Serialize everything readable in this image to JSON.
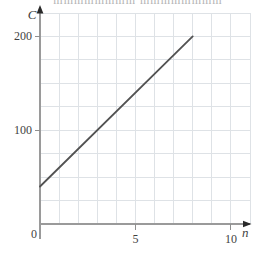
{
  "page": {
    "background": "#ffffff",
    "top_cropped_text": "mmmmmmmm mmmmmmmm"
  },
  "chart_data": {
    "type": "line",
    "title": "",
    "xlabel": "n",
    "ylabel": "C",
    "xlim": [
      0,
      11
    ],
    "ylim": [
      0,
      225
    ],
    "x_grid_step": 1,
    "y_grid_step": 25,
    "grid": true,
    "legend": "none",
    "x_ticks": [
      {
        "value": 5,
        "label": "5"
      },
      {
        "value": 10,
        "label": "10"
      }
    ],
    "y_ticks": [
      {
        "value": 100,
        "label": "100"
      },
      {
        "value": 200,
        "label": "200"
      }
    ],
    "origin_label": "0",
    "series": [
      {
        "name": "cost-line",
        "points": [
          [
            0,
            40
          ],
          [
            8,
            200
          ]
        ]
      }
    ],
    "equation_hint": "C = 20n + 40",
    "colors": {
      "grid": "#dee2e6",
      "axis": "#9a9a9a",
      "tick": "#8f8f8f",
      "arrow": "#2a2a2a",
      "line": "#525252",
      "label": "#3f3f3f"
    }
  }
}
